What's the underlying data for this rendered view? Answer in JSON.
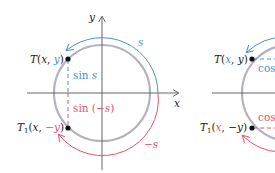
{
  "colors": {
    "circle": "#b3b3bf",
    "axis": "#555555",
    "blue": "#4a90c8",
    "red": "#e0566e",
    "text": "#222222",
    "point": "#111111"
  },
  "left_figure": {
    "axis_x_label": "x",
    "axis_y_label": "y",
    "point_T": {
      "name": "T",
      "coords_x": "x",
      "coords_y": "y"
    },
    "point_T1": {
      "name": "T",
      "subscript": "1",
      "coords_x": "x",
      "coords_y": "−y"
    },
    "sin_s_label": "sin s",
    "sin_neg_s_label": "sin (−s)",
    "arc_s_label": "s",
    "arc_neg_s_label": "−s"
  },
  "right_figure": {
    "point_T": {
      "name": "T",
      "coords_x": "x",
      "coords_y": "y"
    },
    "point_T1": {
      "name": "T",
      "subscript": "1",
      "coords_x": "x",
      "coords_y": "−y"
    },
    "cos_top_label": "cos",
    "cos_bottom_label": "cos"
  }
}
